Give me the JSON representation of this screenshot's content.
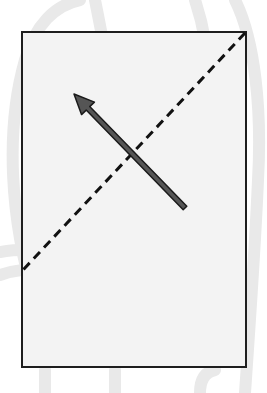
{
  "canvas": {
    "width": 267,
    "height": 393,
    "background": "#ffffff"
  },
  "ghost_shapes": {
    "color": "#e9e9e9",
    "paths": [
      "M 35 300 C 10 220, 5 130, 25 60 C 35 25, 55 5, 80 0",
      "M 95 0 C 100 25, 105 50, 110 80",
      "M 195 0 C 205 30, 210 60, 208 95",
      "M 235 0 C 255 40, 262 110, 258 180 C 255 250, 250 320, 245 393",
      "M 45 393 L 45 370",
      "M 115 393 L 115 370",
      "M 200 393 C 200 380, 205 372, 215 370",
      "M 0 252 C 20 248, 45 250, 70 252",
      "M 0 275 C 15 270, 30 268, 60 268"
    ]
  },
  "panel": {
    "x": 22,
    "y": 32,
    "width": 224,
    "height": 335,
    "fill": "#f3f3f3",
    "stroke": "#1e1e1e",
    "stroke_width": 2
  },
  "fold_line": {
    "label": "dashed diagonal",
    "x1": 245,
    "y1": 33,
    "x2": 23,
    "y2": 270,
    "stroke": "#111111",
    "stroke_width": 3,
    "dash": "9 6"
  },
  "arrow": {
    "label": "direction arrow",
    "tail_x": 185,
    "tail_y": 208,
    "tip_x": 74,
    "tip_y": 94,
    "shaft_fill": "#555555",
    "outline": "#1a1a1a",
    "shaft_width": 5,
    "head_length": 20,
    "head_width": 18
  }
}
